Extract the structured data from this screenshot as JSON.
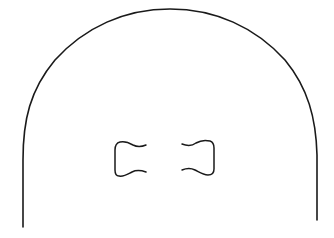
{
  "figure": {
    "background": "#ffffff",
    "stroke_color": "#1a1a1a",
    "outline": {
      "shape": "arch",
      "top_y": 9,
      "center_x": 170,
      "left_x": 23,
      "right_x": 317,
      "arc_join_y": 155,
      "left_bottom_y": 227,
      "right_bottom_y": 220,
      "stroke_width": 1.6
    },
    "inner_shapes": [
      {
        "name": "left-bracket",
        "orientation": "opens-right",
        "x_min": 114,
        "x_max": 147,
        "y_min": 142,
        "y_max": 177
      },
      {
        "name": "right-bracket",
        "orientation": "opens-left",
        "x_min": 182,
        "x_max": 215,
        "y_min": 140,
        "y_max": 175
      }
    ]
  }
}
